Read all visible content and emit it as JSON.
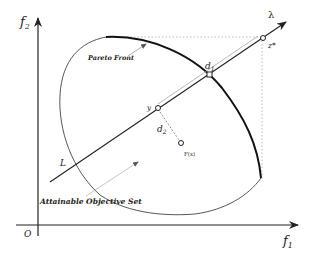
{
  "diagram": {
    "axes": {
      "x_label": "f",
      "x_sub": "1",
      "y_label": "f",
      "y_sub": "2",
      "origin_label": "O"
    },
    "labels": {
      "pareto_front": "Pareto Front",
      "attainable_set": "Attainable Objective Set",
      "line": "L",
      "direction": "λ",
      "ideal_point": "z*",
      "d1": "d",
      "d1_sub": "1",
      "d2": "d",
      "d2_sub": "2",
      "y_point": "y",
      "fx_point": "F(x)"
    },
    "colors": {
      "stroke": "#222222",
      "guide": "#999999",
      "background": "#ffffff"
    }
  }
}
